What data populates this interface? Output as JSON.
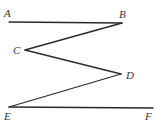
{
  "diagram": {
    "type": "geometry",
    "colors": {
      "line": "#2a2a2a",
      "label": "#333333",
      "background": "#ffffff"
    },
    "points": {
      "A": {
        "label": "A",
        "x": 9,
        "y": 22,
        "label_x": 4,
        "label_y": 17
      },
      "B": {
        "label": "B",
        "x": 122,
        "y": 23,
        "label_x": 119,
        "label_y": 18
      },
      "C": {
        "label": "C",
        "x": 25,
        "y": 50,
        "label_x": 13,
        "label_y": 54
      },
      "D": {
        "label": "D",
        "x": 121,
        "y": 74,
        "label_x": 126,
        "label_y": 79
      },
      "E": {
        "label": "E",
        "x": 9,
        "y": 107,
        "label_x": 4,
        "label_y": 120
      },
      "F": {
        "label": "F",
        "x": 153,
        "y": 108,
        "label_x": 145,
        "label_y": 120
      }
    },
    "segments": [
      [
        "A",
        "B"
      ],
      [
        "B",
        "C"
      ],
      [
        "C",
        "D"
      ],
      [
        "D",
        "E"
      ],
      [
        "E",
        "F"
      ]
    ]
  }
}
